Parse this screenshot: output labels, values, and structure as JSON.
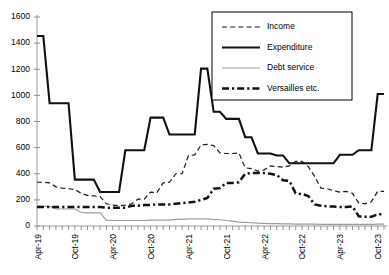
{
  "chart_data": {
    "type": "line",
    "title": "",
    "xlabel": "",
    "ylabel": "",
    "ylim": [
      0,
      1600
    ],
    "yticks": [
      0,
      200,
      400,
      600,
      800,
      1000,
      1200,
      1400,
      1600
    ],
    "ytick_labels": [
      "0",
      "200",
      "400",
      "600",
      "800",
      "1000",
      "1200",
      "1400",
      "1600"
    ],
    "grid": false,
    "legend_position": "top-right",
    "x": [
      "Apr-19",
      "May-19",
      "Jun-19",
      "Jul-19",
      "Aug-19",
      "Sep-19",
      "Oct-19",
      "Nov-19",
      "Dec-19",
      "Jan-20",
      "Feb-20",
      "Mar-20",
      "Apr-20",
      "May-20",
      "Jun-20",
      "Jul-20",
      "Aug-20",
      "Sep-20",
      "Oct-20",
      "Nov-20",
      "Dec-20",
      "Jan-21",
      "Feb-21",
      "Mar-21",
      "Apr-21",
      "May-21",
      "Jun-21",
      "Jul-21",
      "Aug-21",
      "Sep-21",
      "Oct-21",
      "Nov-21",
      "Dec-21",
      "Jan-22",
      "Feb-22",
      "Mar-22",
      "Apr-22",
      "May-22",
      "Jun-22",
      "Jul-22",
      "Aug-22",
      "Sep-22",
      "Oct-22",
      "Nov-22",
      "Dec-22",
      "Jan-23",
      "Feb-23",
      "Mar-23",
      "Apr-23",
      "May-23",
      "Jun-23",
      "Jul-23",
      "Aug-23",
      "Sep-23",
      "Oct-23",
      "Nov-23"
    ],
    "xtick_labels": [
      "Apr-19",
      "Oct-19",
      "Apr-20",
      "Oct-20",
      "Apr-21",
      "Oct-21",
      "Apr-22",
      "Oct-22",
      "Apr-23",
      "Oct-23"
    ],
    "xtick_indices": [
      0,
      6,
      12,
      18,
      24,
      30,
      36,
      42,
      48,
      54
    ],
    "series": [
      {
        "name": "Income",
        "style": "dashed-thin",
        "color": "#1a1a1a",
        "values": [
          335,
          335,
          330,
          300,
          290,
          285,
          280,
          250,
          235,
          230,
          225,
          170,
          160,
          155,
          160,
          170,
          205,
          205,
          260,
          255,
          330,
          335,
          400,
          400,
          540,
          545,
          620,
          625,
          615,
          560,
          555,
          555,
          560,
          445,
          440,
          420,
          430,
          460,
          455,
          450,
          460,
          495,
          495,
          455,
          380,
          290,
          285,
          270,
          260,
          265,
          250,
          175,
          170,
          185,
          265,
          265
        ]
      },
      {
        "name": "Expenditure",
        "style": "solid-thick",
        "color": "#111111",
        "values": [
          1455,
          1455,
          940,
          940,
          940,
          940,
          355,
          355,
          355,
          355,
          260,
          260,
          260,
          260,
          580,
          580,
          580,
          580,
          830,
          830,
          830,
          700,
          700,
          700,
          700,
          700,
          1205,
          1205,
          875,
          875,
          820,
          820,
          820,
          680,
          680,
          555,
          555,
          555,
          540,
          540,
          480,
          480,
          480,
          480,
          480,
          480,
          480,
          480,
          545,
          545,
          545,
          580,
          580,
          580,
          1010,
          1010
        ]
      },
      {
        "name": "Debt service",
        "style": "solid-thin",
        "color": "#9d9d9d",
        "values": [
          150,
          150,
          150,
          130,
          130,
          130,
          130,
          105,
          100,
          100,
          100,
          45,
          42,
          42,
          42,
          42,
          42,
          42,
          45,
          45,
          45,
          45,
          50,
          50,
          55,
          55,
          55,
          55,
          50,
          48,
          42,
          38,
          30,
          28,
          25,
          22,
          20,
          18,
          18,
          16,
          16,
          15,
          15,
          14,
          14,
          13,
          13,
          12,
          12,
          12,
          12,
          12,
          12,
          12,
          14,
          14
        ]
      },
      {
        "name": "Versailles etc.",
        "style": "dashdot-thick",
        "color": "#111111",
        "values": [
          145,
          145,
          145,
          145,
          145,
          145,
          145,
          145,
          145,
          145,
          145,
          140,
          140,
          140,
          140,
          155,
          155,
          160,
          160,
          165,
          165,
          165,
          170,
          175,
          180,
          185,
          200,
          215,
          285,
          290,
          330,
          330,
          335,
          400,
          405,
          405,
          405,
          400,
          390,
          350,
          345,
          250,
          245,
          230,
          165,
          155,
          150,
          150,
          145,
          145,
          150,
          75,
          70,
          70,
          90,
          90
        ]
      }
    ]
  },
  "legend": {
    "items": [
      {
        "label": "Income"
      },
      {
        "label": "Expenditure"
      },
      {
        "label": "Debt service"
      },
      {
        "label": "Versailles etc."
      }
    ]
  }
}
